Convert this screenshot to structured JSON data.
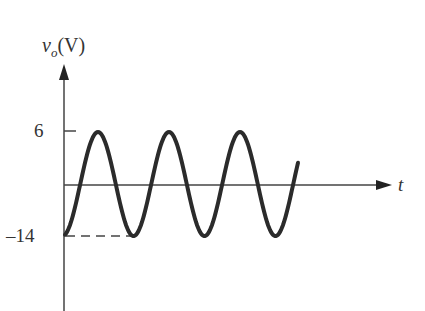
{
  "chart_data": {
    "type": "line",
    "title": "",
    "ylabel": "v_o (V)",
    "ylabel_parts": {
      "var": "v",
      "sub": "o",
      "unit": "(V)"
    },
    "xlabel": "t",
    "yticks": [
      {
        "label": "6",
        "value": 6
      },
      {
        "label": "–14",
        "value": -14
      }
    ],
    "ylim": [
      -14,
      6
    ],
    "grid": false,
    "legend": null,
    "annotations": [
      "dashed line at -14 V from y-axis to first trough"
    ],
    "series": [
      {
        "name": "v_o",
        "description": "Sinusoid oscillating between +6 V and -14 V (about 3 cycles), starting at about -4 V",
        "max": 6,
        "min": -14,
        "cycles": 3.3
      }
    ]
  },
  "labels": {
    "y_var": "v",
    "y_sub": "o",
    "y_unit": "(V)",
    "tick_top": "6",
    "tick_bottom": "–14",
    "x_var": "t"
  },
  "colors": {
    "axis": "#333333",
    "curve": "#2b2b2b",
    "text": "#333333"
  }
}
